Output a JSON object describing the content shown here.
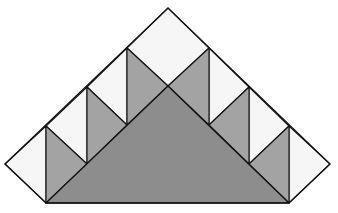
{
  "diagram": {
    "colors": {
      "light": "#f6f6f6",
      "mid": "#a3a3a3",
      "dark": "#8d8d8d",
      "stroke": "#111111"
    },
    "outline": {
      "apex": [
        168,
        8
      ],
      "left_tip": [
        5,
        164
      ],
      "right_tip": [
        330,
        164
      ],
      "bottom_left": [
        46,
        203
      ],
      "bottom_right": [
        289,
        203
      ]
    },
    "big_triangle": [
      [
        46,
        203
      ],
      [
        168,
        86
      ],
      [
        289,
        203
      ]
    ],
    "light_shapes": [
      [
        [
          5,
          164
        ],
        [
          46,
          126
        ],
        [
          46,
          203
        ]
      ],
      [
        [
          46,
          126
        ],
        [
          87,
          87
        ],
        [
          87,
          164
        ]
      ],
      [
        [
          87,
          87
        ],
        [
          127,
          48
        ],
        [
          127,
          125
        ]
      ],
      [
        [
          127,
          48
        ],
        [
          168,
          8
        ],
        [
          209,
          48
        ],
        [
          168,
          86
        ]
      ],
      [
        [
          209,
          48
        ],
        [
          249,
          87
        ],
        [
          209,
          125
        ]
      ],
      [
        [
          249,
          87
        ],
        [
          289,
          126
        ],
        [
          249,
          164
        ]
      ],
      [
        [
          289,
          126
        ],
        [
          330,
          164
        ],
        [
          289,
          203
        ]
      ]
    ],
    "mid_shapes": [
      [
        [
          46,
          126
        ],
        [
          87,
          164
        ],
        [
          46,
          203
        ]
      ],
      [
        [
          87,
          87
        ],
        [
          127,
          125
        ],
        [
          87,
          164
        ]
      ],
      [
        [
          127,
          48
        ],
        [
          168,
          86
        ],
        [
          127,
          125
        ]
      ],
      [
        [
          209,
          48
        ],
        [
          209,
          125
        ],
        [
          168,
          86
        ]
      ],
      [
        [
          249,
          87
        ],
        [
          249,
          164
        ],
        [
          209,
          125
        ]
      ],
      [
        [
          289,
          126
        ],
        [
          289,
          203
        ],
        [
          249,
          164
        ]
      ]
    ]
  }
}
